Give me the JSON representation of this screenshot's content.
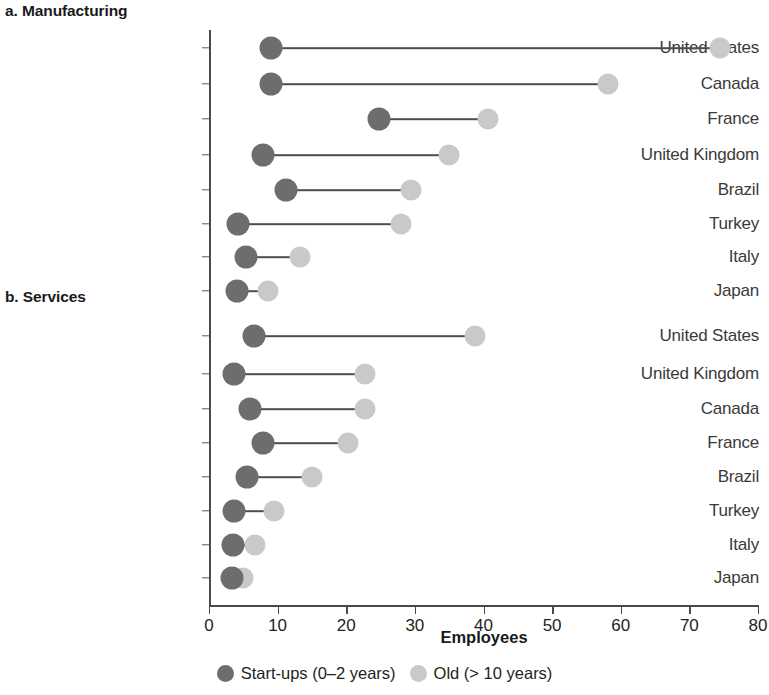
{
  "panels": {
    "a_label": "a. Manufacturing",
    "b_label": "b. Services"
  },
  "axis": {
    "title": "Employees",
    "ticks": [
      "0",
      "10",
      "20",
      "30",
      "40",
      "50",
      "60",
      "70",
      "80"
    ]
  },
  "legend": {
    "items": [
      {
        "label": "Start-ups (0–2 years)",
        "color": "#6d6d6d",
        "icon": "circle-marker-icon"
      },
      {
        "label": "Old (> 10 years)",
        "color": "#c9c9c9",
        "icon": "circle-marker-icon"
      }
    ]
  },
  "chart_data": {
    "type": "scatter",
    "subtype": "dumbbell",
    "title": "",
    "xlabel": "Employees",
    "ylabel": "",
    "xlim": [
      0,
      80
    ],
    "xticks": [
      0,
      10,
      20,
      30,
      40,
      50,
      60,
      70,
      80
    ],
    "grid": false,
    "legend_position": "bottom",
    "series": [
      {
        "name": "Start-ups (0–2 years)",
        "color": "#6d6d6d"
      },
      {
        "name": "Old (> 10 years)",
        "color": "#c9c9c9"
      }
    ],
    "panels": [
      {
        "panel": "a. Manufacturing",
        "categories": [
          "United States",
          "Canada",
          "France",
          "United Kingdom",
          "Brazil",
          "Turkey",
          "Italy",
          "Japan"
        ],
        "startups": [
          9.0,
          9.0,
          24.7,
          7.9,
          11.2,
          4.2,
          5.4,
          4.1
        ],
        "old": [
          74.5,
          58.2,
          40.7,
          35.0,
          29.5,
          28.0,
          13.3,
          8.6
        ]
      },
      {
        "panel": "b. Services",
        "categories": [
          "United States",
          "United Kingdom",
          "Canada",
          "France",
          "Brazil",
          "Turkey",
          "Italy",
          "Japan"
        ],
        "startups": [
          6.6,
          3.6,
          6.0,
          7.8,
          5.5,
          3.6,
          3.5,
          3.4
        ],
        "old": [
          38.8,
          22.7,
          22.8,
          20.3,
          15.0,
          9.5,
          6.7,
          5.0
        ]
      }
    ]
  }
}
